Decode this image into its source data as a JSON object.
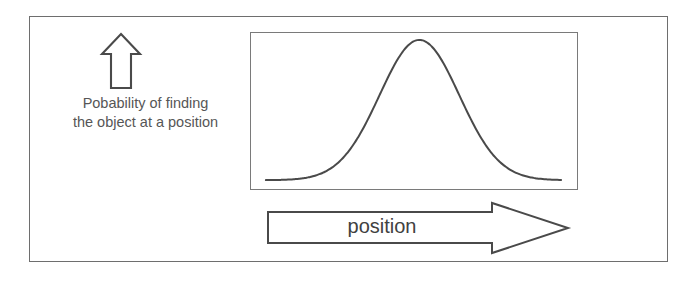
{
  "figure": {
    "background_color": "#ffffff",
    "frame_color": "#6e6e6e",
    "ink_color": "#4a4a4a",
    "text_color": "#565656"
  },
  "y_axis": {
    "arrow_icon_name": "up-arrow-icon",
    "arrow_direction": "up",
    "caption_line_1": "Pobability of finding",
    "caption_line_2": "the object at a position"
  },
  "x_axis": {
    "arrow_icon_name": "right-arrow-icon",
    "arrow_direction": "right",
    "label": "position"
  },
  "chart_data": {
    "type": "line",
    "title": "",
    "subtitle": "",
    "xlabel": "position",
    "ylabel": "Pobability of finding the object at a position",
    "grid": false,
    "legend_position": "none",
    "axis_tick_labels_x": [],
    "axis_tick_labels_y": [],
    "xlim": [
      0,
      1
    ],
    "ylim": [
      0,
      1
    ],
    "annotations": [],
    "series": [
      {
        "name": "probability density",
        "description": "Gaussian bell curve, single peak near centre of panel",
        "distribution": "gaussian",
        "mean": 0.52,
        "sigma": 0.135,
        "peak_value": 1.0,
        "baseline_value": 0.02,
        "x": [
          0.0,
          0.05,
          0.1,
          0.15,
          0.2,
          0.25,
          0.3,
          0.35,
          0.4,
          0.45,
          0.5,
          0.52,
          0.55,
          0.6,
          0.65,
          0.7,
          0.75,
          0.8,
          0.85,
          0.9,
          0.95,
          1.0
        ],
        "y": [
          0.02,
          0.02,
          0.03,
          0.04,
          0.06,
          0.11,
          0.2,
          0.35,
          0.56,
          0.8,
          0.98,
          1.0,
          0.97,
          0.84,
          0.62,
          0.4,
          0.22,
          0.11,
          0.05,
          0.03,
          0.02,
          0.02
        ]
      }
    ]
  }
}
